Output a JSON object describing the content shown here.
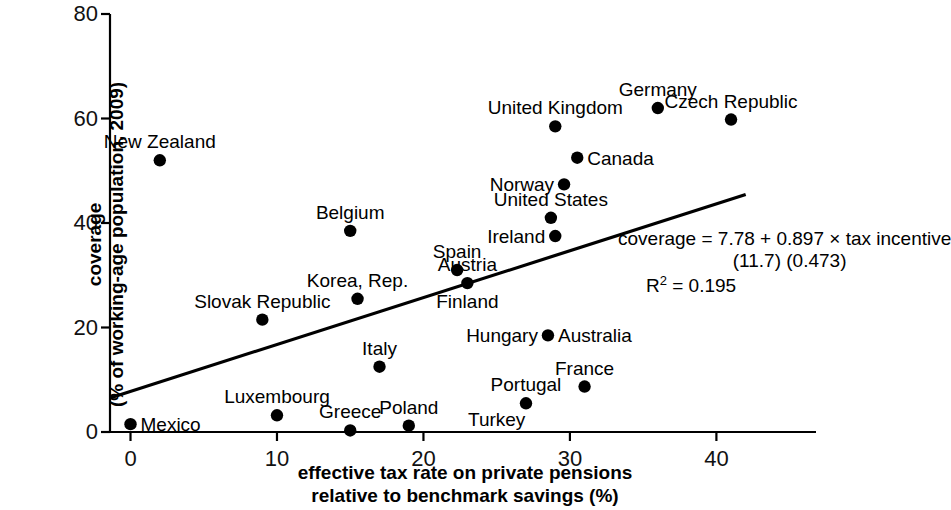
{
  "chart_data": {
    "type": "scatter",
    "title": "",
    "xlabel": "effective tax rate on private pensions\nrelative to benchmark savings (%)",
    "ylabel": "coverage\n(% of working-age population, 2009)",
    "xlim": [
      -1.4,
      46.8
    ],
    "ylim": [
      0,
      80
    ],
    "xticks": [
      0,
      10,
      20,
      30,
      40
    ],
    "yticks": [
      0,
      20,
      40,
      60,
      80
    ],
    "xtick_labels": [
      "0",
      "10",
      "20",
      "30",
      "40"
    ],
    "ytick_labels": [
      "0",
      "20",
      "40",
      "60",
      "80"
    ],
    "grid": false,
    "legend": "none",
    "marker_color": "#000000",
    "line_color": "#000000",
    "points": [
      {
        "label": "New Zealand",
        "x": 2.0,
        "y": 52.0,
        "pos": "above"
      },
      {
        "label": "Germany",
        "x": 36.0,
        "y": 62.0,
        "pos": "above"
      },
      {
        "label": "Czech Republic",
        "x": 41.0,
        "y": 59.8,
        "pos": "above"
      },
      {
        "label": "United Kingdom",
        "x": 29.0,
        "y": 58.5,
        "pos": "above"
      },
      {
        "label": "Canada",
        "x": 30.5,
        "y": 52.5,
        "pos": "right"
      },
      {
        "label": "Norway",
        "x": 29.6,
        "y": 47.4,
        "pos": "left"
      },
      {
        "label": "United States",
        "x": 28.7,
        "y": 41.0,
        "pos": "above"
      },
      {
        "label": "Belgium",
        "x": 15.0,
        "y": 38.5,
        "pos": "above"
      },
      {
        "label": "Ireland",
        "x": 29.0,
        "y": 37.5,
        "pos": "left"
      },
      {
        "label": "Spain",
        "x": 22.3,
        "y": 31.0,
        "pos": "above"
      },
      {
        "label": "Austria",
        "x": 23.0,
        "y": 28.5,
        "pos": "above"
      },
      {
        "label": "Finland",
        "x": 23.0,
        "y": 28.5,
        "pos": "below"
      },
      {
        "label": "Korea, Rep.",
        "x": 15.5,
        "y": 25.5,
        "pos": "above"
      },
      {
        "label": "Slovak Republic",
        "x": 9.0,
        "y": 21.5,
        "pos": "above"
      },
      {
        "label": "Hungary",
        "x": 28.5,
        "y": 18.5,
        "pos": "left"
      },
      {
        "label": "Australia",
        "x": 28.5,
        "y": 18.5,
        "pos": "right"
      },
      {
        "label": "Italy",
        "x": 17.0,
        "y": 12.5,
        "pos": "above"
      },
      {
        "label": "France",
        "x": 31.0,
        "y": 8.7,
        "pos": "above"
      },
      {
        "label": "Portugal",
        "x": 27.0,
        "y": 5.5,
        "pos": "above"
      },
      {
        "label": "Luxembourg",
        "x": 10.0,
        "y": 3.2,
        "pos": "above"
      },
      {
        "label": "Mexico",
        "x": 0.0,
        "y": 1.5,
        "pos": "right"
      },
      {
        "label": "Poland",
        "x": 19.0,
        "y": 1.2,
        "pos": "above"
      },
      {
        "label": "Greece",
        "x": 15.0,
        "y": 0.3,
        "pos": "above"
      },
      {
        "label": "Turkey",
        "x": 24.5,
        "y": 0.0,
        "pos": "turkey"
      }
    ],
    "trendline": {
      "intercept": 7.78,
      "slope": 0.897,
      "x_start": -1.4,
      "x_end": 42.0
    },
    "annotation": {
      "equation": "coverage = 7.78 + 0.897 × tax incentive",
      "std_errors": "(11.7)   (0.473)",
      "r_squared_prefix": "R",
      "r_squared_sup": "2",
      "r_squared_value": " = 0.195"
    }
  }
}
